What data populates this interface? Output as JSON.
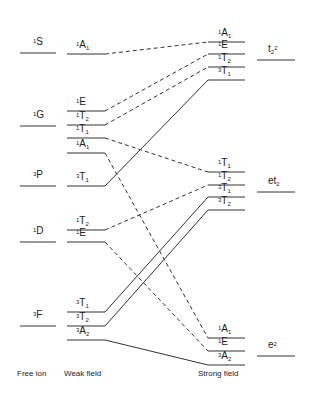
{
  "diagram": {
    "type": "correlation-diagram",
    "column_titles": {
      "free_ion": "Free ion",
      "weak_field": "Weak field",
      "strong_field": "Strong field"
    },
    "free_ion_terms": [
      {
        "mult": "1",
        "term": "S",
        "y": 53
      },
      {
        "mult": "1",
        "term": "G",
        "y": 126
      },
      {
        "mult": "3",
        "term": "P",
        "y": 186
      },
      {
        "mult": "1",
        "term": "D",
        "y": 242
      },
      {
        "mult": "3",
        "term": "F",
        "y": 326
      }
    ],
    "weak_field_states": [
      {
        "mult": "1",
        "sym": "A",
        "sub": "1",
        "y": 54
      },
      {
        "mult": "1",
        "sym": "E",
        "sub": "",
        "y": 111
      },
      {
        "mult": "1",
        "sym": "T",
        "sub": "2",
        "y": 125
      },
      {
        "mult": "1",
        "sym": "T",
        "sub": "1",
        "y": 138
      },
      {
        "mult": "1",
        "sym": "A",
        "sub": "1",
        "y": 153
      },
      {
        "mult": "3",
        "sym": "T",
        "sub": "1",
        "y": 186
      },
      {
        "mult": "1",
        "sym": "T",
        "sub": "2",
        "y": 230
      },
      {
        "mult": "1",
        "sym": "E",
        "sub": "",
        "y": 242
      },
      {
        "mult": "3",
        "sym": "T",
        "sub": "1",
        "y": 312
      },
      {
        "mult": "3",
        "sym": "T",
        "sub": "2",
        "y": 326
      },
      {
        "mult": "3",
        "sym": "A",
        "sub": "2",
        "y": 340
      }
    ],
    "strong_field_states": [
      {
        "mult": "1",
        "sym": "A",
        "sub": "1",
        "y": 42
      },
      {
        "mult": "1",
        "sym": "E",
        "sub": "",
        "y": 54
      },
      {
        "mult": "1",
        "sym": "T",
        "sub": "2",
        "y": 67
      },
      {
        "mult": "3",
        "sym": "T",
        "sub": "1",
        "y": 80
      },
      {
        "mult": "1",
        "sym": "T",
        "sub": "1",
        "y": 172
      },
      {
        "mult": "1",
        "sym": "T",
        "sub": "2",
        "y": 185
      },
      {
        "mult": "3",
        "sym": "T",
        "sub": "1",
        "y": 197
      },
      {
        "mult": "3",
        "sym": "T",
        "sub": "2",
        "y": 210
      },
      {
        "mult": "1",
        "sym": "A",
        "sub": "1",
        "y": 338
      },
      {
        "mult": "1",
        "sym": "E",
        "sub": "",
        "y": 351
      },
      {
        "mult": "3",
        "sym": "A",
        "sub": "2",
        "y": 365
      }
    ],
    "configurations": [
      {
        "base": "t",
        "sub": "2",
        "sup": "2",
        "y": 60
      },
      {
        "base": "et",
        "sub": "2",
        "sup": "",
        "y": 192
      },
      {
        "base": "e",
        "sub": "",
        "sup": "2",
        "y": 356
      }
    ],
    "correlations": [
      {
        "from": 0,
        "to": 0,
        "style": "dashed"
      },
      {
        "from": 1,
        "to": 1,
        "style": "dashed"
      },
      {
        "from": 2,
        "to": 2,
        "style": "dashed"
      },
      {
        "from": 3,
        "to": 4,
        "style": "dashed"
      },
      {
        "from": 4,
        "to": 8,
        "style": "dashed"
      },
      {
        "from": 5,
        "to": 3,
        "style": "solid"
      },
      {
        "from": 6,
        "to": 5,
        "style": "dashed"
      },
      {
        "from": 7,
        "to": 9,
        "style": "dashed"
      },
      {
        "from": 8,
        "to": 6,
        "style": "solid"
      },
      {
        "from": 9,
        "to": 7,
        "style": "solid"
      },
      {
        "from": 10,
        "to": 10,
        "style": "solid"
      }
    ]
  }
}
